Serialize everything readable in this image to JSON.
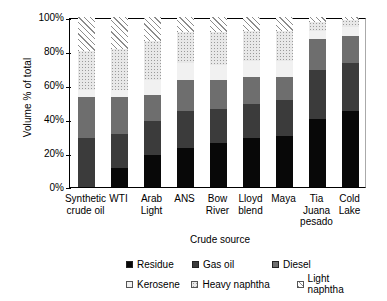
{
  "chart_data": {
    "type": "bar",
    "subtype": "stacked-bar-100pct",
    "title": "",
    "xlabel": "Crude source",
    "ylabel": "Volume % of total",
    "ylim": [
      0,
      100
    ],
    "yticks": [
      "0%",
      "20%",
      "40%",
      "60%",
      "80%",
      "100%"
    ],
    "grid": false,
    "legend_position": "bottom",
    "categories": [
      "Synthetic crude oil",
      "WTI",
      "Arab Light",
      "ANS",
      "Bow River",
      "Lloyd blend",
      "Maya",
      "Tia Juana pesado",
      "Cold Lake"
    ],
    "series": [
      {
        "name": "Residue",
        "values": [
          0,
          11,
          19,
          23,
          26,
          29,
          30,
          40,
          45
        ]
      },
      {
        "name": "Gas oil",
        "values": [
          29,
          20,
          20,
          22,
          20,
          20,
          21,
          29,
          28
        ]
      },
      {
        "name": "Diesel",
        "values": [
          24,
          22,
          15,
          18,
          17,
          16,
          14,
          18,
          16
        ]
      },
      {
        "name": "Kerosene",
        "values": [
          4,
          4,
          9,
          10,
          9,
          9,
          9,
          5,
          5
        ]
      },
      {
        "name": "Heavy naphtha",
        "values": [
          23,
          24,
          23,
          18,
          19,
          18,
          18,
          5,
          4
        ]
      },
      {
        "name": "Light naphtha",
        "values": [
          20,
          19,
          14,
          9,
          9,
          8,
          8,
          3,
          2
        ]
      }
    ]
  },
  "axis": {
    "ylabel": "Volume % of total",
    "xlabel": "Crude source",
    "yticks": [
      "100%",
      "80%",
      "60%",
      "40%",
      "20%",
      "0%"
    ]
  },
  "xlabels": [
    {
      "line1": "Synthetic",
      "line2": "crude oil"
    },
    {
      "line1": "WTI",
      "line2": ""
    },
    {
      "line1": "Arab",
      "line2": "Light"
    },
    {
      "line1": "ANS",
      "line2": ""
    },
    {
      "line1": "Bow",
      "line2": "River"
    },
    {
      "line1": "Lloyd",
      "line2": "blend"
    },
    {
      "line1": "Maya",
      "line2": ""
    },
    {
      "line1": "Tia",
      "line2": "Juana",
      "line3": "pesado"
    },
    {
      "line1": "Cold",
      "line2": "Lake"
    }
  ],
  "legend": {
    "row1": [
      {
        "label": "Residue",
        "key": "residue",
        "color": "#080808"
      },
      {
        "label": "Gas oil",
        "key": "gasoil",
        "color": "#3b3b3b"
      },
      {
        "label": "Diesel",
        "key": "diesel",
        "color": "#6e6e6e"
      }
    ],
    "row2": [
      {
        "label": "Kerosene",
        "key": "kerosene",
        "color": "#f1f1f1"
      },
      {
        "label": "Heavy naphtha",
        "key": "heavy",
        "color": "#e8e8e8"
      },
      {
        "label": "Light naphtha",
        "key": "light",
        "color": "#ffffff"
      }
    ]
  }
}
